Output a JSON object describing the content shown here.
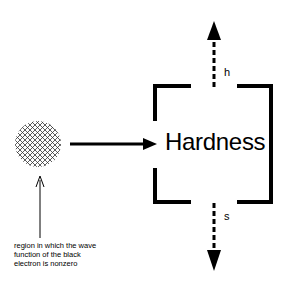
{
  "diagram": {
    "box_label": "Hardness",
    "arrow_up_label": "h",
    "arrow_down_label": "s",
    "caption_lines": [
      "region in which the wave",
      "function of the black",
      "electron is nonzero"
    ],
    "elements": [
      {
        "type": "hatched-circle",
        "meaning": "electron wave function region"
      },
      {
        "type": "arrow",
        "from": "hatched-circle",
        "to": "hardness-box",
        "style": "solid"
      },
      {
        "type": "arrow",
        "from": "hardness-box",
        "direction": "up",
        "style": "dashed",
        "label": "h"
      },
      {
        "type": "arrow",
        "from": "hardness-box",
        "direction": "down",
        "style": "dashed",
        "label": "s"
      },
      {
        "type": "arrow",
        "from": "caption",
        "to": "hatched-circle",
        "style": "thin"
      }
    ]
  }
}
